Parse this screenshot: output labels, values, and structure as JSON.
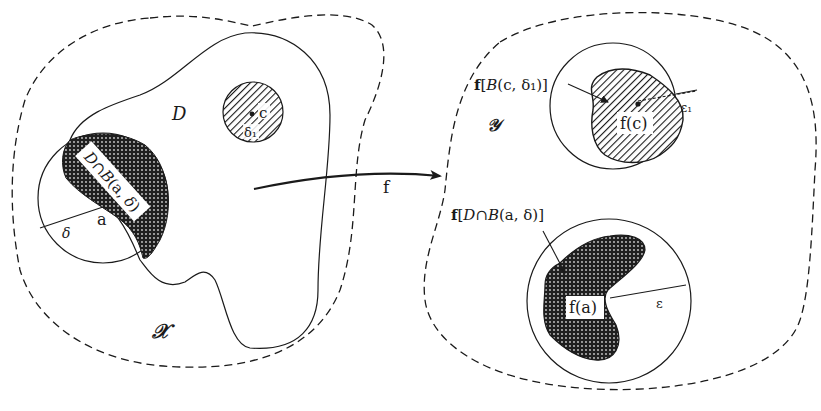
{
  "figure": {
    "type": "continuity-mapping-diagram",
    "colors": {
      "ink": "#1a1a1a",
      "background": "#ffffff",
      "dotted_fill_dark": "#222222",
      "hatch": "#1a1a1a"
    }
  },
  "domain_space": {
    "label": "𝒳",
    "set_label": "D",
    "ball_a": {
      "center_label": "a",
      "radius_label": "δ",
      "intersection_label": "D∩B(a, δ)"
    },
    "ball_c": {
      "center_label": "c",
      "radius_label": "δ₁"
    }
  },
  "mapping": {
    "label": "f"
  },
  "codomain_space": {
    "label": "𝒴",
    "image_c": {
      "callout": "f[B(c, δ₁)]",
      "point_label": "f(c)",
      "radius_label": "ε₁"
    },
    "image_a": {
      "callout": "f[D∩B(a, δ)]",
      "point_label": "f(a)",
      "radius_label": "ε"
    }
  }
}
